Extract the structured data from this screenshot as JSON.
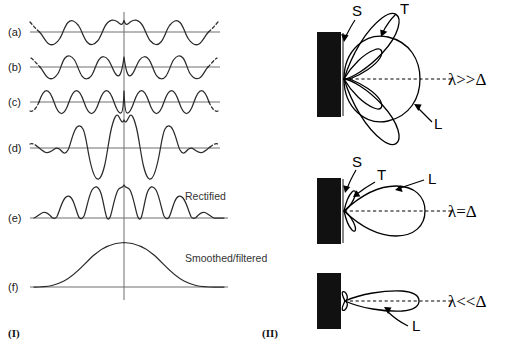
{
  "figure": {
    "title_visible": false,
    "panels": [
      {
        "id": "I",
        "caption": "(I)",
        "rows": [
          {
            "label": "(a)",
            "kind": "sine",
            "cycles": 3.9,
            "amplitude": 12,
            "phase_deg": 0,
            "dashed_ends": true,
            "annotation": ""
          },
          {
            "label": "(b)",
            "kind": "sine",
            "cycles": 4.6,
            "amplitude": 12,
            "phase_deg": 0,
            "dashed_ends": true,
            "annotation": ""
          },
          {
            "label": "(c)",
            "kind": "sine",
            "cycles": 5.4,
            "amplitude": 12,
            "phase_deg": 0,
            "dashed_ends": true,
            "annotation": ""
          },
          {
            "label": "(d)",
            "kind": "sum-packet",
            "amplitude": 34,
            "dashed_ends": true,
            "annotation": ""
          },
          {
            "label": "(e)",
            "kind": "rectified",
            "amplitude": 30,
            "dashed_ends": false,
            "annotation": "Rectified"
          },
          {
            "label": "(f)",
            "kind": "envelope",
            "amplitude": 40,
            "dashed_ends": false,
            "annotation": "Smoothed/filtered"
          }
        ]
      },
      {
        "id": "II",
        "caption": "(II)",
        "diagrams": [
          {
            "condition": "λ>>Δ",
            "letters": [
              {
                "text": "S",
                "meaning": "source-transducer-face"
              },
              {
                "text": "T",
                "meaning": "side-lobe"
              },
              {
                "text": "L",
                "meaning": "main-lobe"
              }
            ],
            "beam_type": "broad-multilobe"
          },
          {
            "condition": "λ=Δ",
            "letters": [
              {
                "text": "S",
                "meaning": "source-transducer-face"
              },
              {
                "text": "T",
                "meaning": "side-lobe"
              },
              {
                "text": "L",
                "meaning": "main-lobe"
              }
            ],
            "beam_type": "single-broad-lobe"
          },
          {
            "condition": "λ<<Δ",
            "letters": [
              {
                "text": "L",
                "meaning": "main-lobe"
              }
            ],
            "beam_type": "narrow-pencil-beam"
          }
        ]
      }
    ]
  },
  "colors": {
    "ink": "#1a1a1a",
    "wave": "#2b2b2b",
    "axis": "#6e6e6e",
    "slab": "#111111",
    "background": "#ffffff"
  }
}
